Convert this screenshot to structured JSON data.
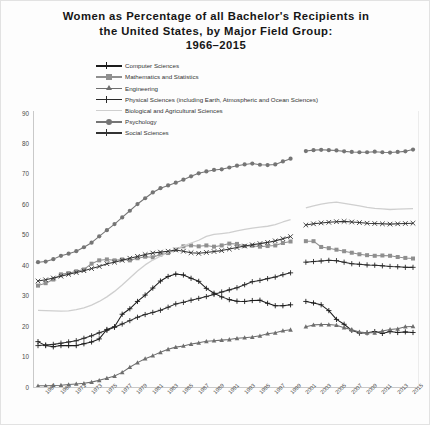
{
  "title": {
    "line1": "Women as Percentage of all Bachelor's Recipients in",
    "line2": "the United States, by Major Field Group:",
    "line3": "1966–2015"
  },
  "legend": {
    "position": "top-center",
    "items": [
      {
        "label": "Computer Sciences",
        "color": "#1c1c1c",
        "marker": "plus"
      },
      {
        "label": "Mathematics and Statistics",
        "color": "#8f8f8f",
        "marker": "square"
      },
      {
        "label": "Engineering",
        "color": "#6e6e6e",
        "marker": "triangle"
      },
      {
        "label": "Physical Sciences (including Earth, Atmospheric and Ocean Sciences)",
        "color": "#2a2a2a",
        "marker": "plus"
      },
      {
        "label": "Biological and Agricultural Sciences",
        "color": "#cfcfcf",
        "marker": "none"
      },
      {
        "label": "Psychology",
        "color": "#757575",
        "marker": "circle"
      },
      {
        "label": "Social Sciences",
        "color": "#333333",
        "marker": "cross"
      }
    ]
  },
  "chart_data": {
    "type": "line",
    "title": "Women as Percentage of all Bachelor's Recipients in the United States, by Major Field Group: 1966–2015",
    "xlabel": "",
    "ylabel": "",
    "ylim": [
      0,
      90
    ],
    "ytick_step": 10,
    "yticks": [
      0,
      10,
      20,
      30,
      40,
      50,
      60,
      70,
      80,
      90
    ],
    "grid": false,
    "xlim": [
      1966,
      2015
    ],
    "x": [
      1966,
      1967,
      1968,
      1969,
      1970,
      1971,
      1972,
      1973,
      1974,
      1975,
      1976,
      1977,
      1978,
      1979,
      1980,
      1981,
      1982,
      1983,
      1984,
      1985,
      1986,
      1987,
      1988,
      1989,
      1990,
      1991,
      1992,
      1993,
      1994,
      1995,
      1996,
      1997,
      1998,
      1999,
      2000,
      2001,
      2002,
      2003,
      2004,
      2005,
      2006,
      2007,
      2008,
      2009,
      2010,
      2011,
      2012,
      2013,
      2014,
      2015
    ],
    "xtick_labels": [
      "1967",
      "1969",
      "1971",
      "1973",
      "1975",
      "1977",
      "1979",
      "1981",
      "1983",
      "1985",
      "1987",
      "1989",
      "1991",
      "1993",
      "1995",
      "1997",
      "1999",
      "2001",
      "2003",
      "2005",
      "2007",
      "2009",
      "2011",
      "2013",
      "2015"
    ],
    "series_break_year": 2000,
    "series": [
      {
        "name": "Computer Sciences",
        "color": "#1c1c1c",
        "marker": "plus",
        "values": [
          14.9,
          13.6,
          13.2,
          13.6,
          13.6,
          13.6,
          14.2,
          14.8,
          15.8,
          18.9,
          19.8,
          23.9,
          25.7,
          28.1,
          30.2,
          32.5,
          34.8,
          36.3,
          37.1,
          36.8,
          35.7,
          34.7,
          32.4,
          30.8,
          29.6,
          28.7,
          28.2,
          28.1,
          28.4,
          28.5,
          27.5,
          26.7,
          26.7,
          27.0,
          null,
          28.1,
          27.6,
          27.0,
          25.1,
          22.2,
          20.6,
          18.6,
          17.7,
          17.8,
          18.2,
          17.6,
          18.2,
          17.9,
          18.1,
          17.9
        ]
      },
      {
        "name": "Mathematics and Statistics",
        "color": "#8f8f8f",
        "marker": "square",
        "values": [
          33.3,
          34.1,
          35.3,
          37.0,
          37.4,
          38.0,
          38.6,
          40.5,
          41.6,
          41.9,
          41.6,
          41.9,
          41.6,
          42.3,
          42.8,
          42.6,
          43.5,
          44.0,
          45.1,
          46.2,
          46.5,
          46.2,
          46.5,
          46.1,
          46.5,
          47.1,
          47.0,
          46.3,
          46.4,
          46.1,
          46.3,
          46.5,
          47.3,
          47.8,
          null,
          47.9,
          47.9,
          46.0,
          45.6,
          45.1,
          44.6,
          44.1,
          43.6,
          43.3,
          43.1,
          43.2,
          43.1,
          42.7,
          42.4,
          42.2
        ]
      },
      {
        "name": "Engineering",
        "color": "#6e6e6e",
        "marker": "triangle",
        "values": [
          0.4,
          0.4,
          0.5,
          0.6,
          0.8,
          1.0,
          1.2,
          1.6,
          2.2,
          2.9,
          3.6,
          4.8,
          6.5,
          8.0,
          9.3,
          10.3,
          11.4,
          12.4,
          13.1,
          13.5,
          14.1,
          14.5,
          15.0,
          15.2,
          15.4,
          15.6,
          16.0,
          16.2,
          16.4,
          16.8,
          17.5,
          17.8,
          18.5,
          18.8,
          null,
          19.8,
          20.4,
          20.5,
          20.5,
          20.3,
          19.5,
          18.8,
          18.1,
          17.8,
          17.8,
          18.4,
          18.9,
          19.1,
          19.8,
          19.9
        ]
      },
      {
        "name": "Physical Sciences (including Earth, Atmospheric and Ocean Sciences)",
        "color": "#2a2a2a",
        "marker": "plus",
        "values": [
          13.6,
          13.8,
          14.0,
          14.4,
          14.8,
          15.2,
          16.0,
          16.8,
          17.8,
          18.6,
          19.6,
          20.7,
          21.8,
          22.9,
          23.8,
          24.5,
          25.2,
          26.2,
          27.3,
          27.8,
          28.5,
          29.1,
          29.7,
          30.4,
          31.2,
          31.9,
          32.6,
          33.6,
          34.6,
          35.0,
          35.6,
          36.1,
          36.9,
          37.5,
          null,
          41.0,
          41.2,
          41.4,
          41.6,
          41.5,
          41.0,
          40.5,
          40.3,
          40.1,
          40.0,
          39.8,
          39.6,
          39.5,
          39.3,
          39.3
        ]
      },
      {
        "name": "Biological and Agricultural Sciences",
        "color": "#cfcfcf",
        "marker": "none",
        "values": [
          25.2,
          25.1,
          25.0,
          24.9,
          25.0,
          25.4,
          26.0,
          26.9,
          28.1,
          29.6,
          31.4,
          33.5,
          35.8,
          38.1,
          40.1,
          41.7,
          43.0,
          44.2,
          45.4,
          46.3,
          47.3,
          48.2,
          49.5,
          50.1,
          50.4,
          50.7,
          51.3,
          51.8,
          52.2,
          52.5,
          52.8,
          53.3,
          54.2,
          55.0,
          null,
          58.8,
          59.5,
          60.1,
          60.5,
          60.7,
          60.3,
          59.9,
          59.5,
          59.0,
          58.7,
          58.5,
          58.3,
          58.4,
          58.5,
          58.6
        ]
      },
      {
        "name": "Psychology",
        "color": "#757575",
        "marker": "circle",
        "values": [
          41.0,
          41.2,
          42.0,
          43.1,
          43.8,
          44.6,
          45.9,
          47.4,
          49.5,
          51.5,
          53.5,
          55.7,
          57.9,
          60.1,
          62.0,
          63.9,
          65.3,
          66.2,
          67.1,
          68.1,
          69.2,
          70.2,
          70.8,
          71.3,
          71.5,
          72.1,
          72.7,
          73.1,
          73.4,
          73.0,
          72.9,
          73.1,
          74.1,
          75.0,
          null,
          77.5,
          77.8,
          77.9,
          77.8,
          77.7,
          77.4,
          77.2,
          77.1,
          77.1,
          77.3,
          77.1,
          77.0,
          77.2,
          77.4,
          78.0
        ]
      },
      {
        "name": "Social Sciences",
        "color": "#333333",
        "marker": "cross",
        "values": [
          34.8,
          35.2,
          35.8,
          36.4,
          37.0,
          37.6,
          38.2,
          38.9,
          39.6,
          40.5,
          41.0,
          41.6,
          42.3,
          42.9,
          43.5,
          44.0,
          44.3,
          44.6,
          45.0,
          44.6,
          44.1,
          43.9,
          44.2,
          44.5,
          44.8,
          45.3,
          45.8,
          46.3,
          46.7,
          47.1,
          47.5,
          48.0,
          48.7,
          49.4,
          null,
          53.2,
          53.6,
          53.9,
          54.1,
          54.3,
          54.4,
          54.2,
          54.0,
          53.8,
          53.7,
          53.6,
          53.5,
          53.6,
          53.7,
          53.8
        ]
      }
    ]
  }
}
